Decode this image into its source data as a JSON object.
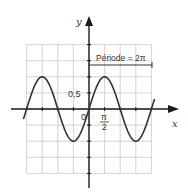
{
  "chart_data": {
    "type": "line",
    "title": "",
    "xlabel": "x",
    "ylabel": "y",
    "function": "y = sin(x)",
    "x_range": [
      -6.6,
      6.6
    ],
    "ylim": [
      -2,
      2
    ],
    "xlim": [
      -6.2832,
      6.2832
    ],
    "grid": true,
    "grid_step_x": "π/2",
    "grid_step_y": 0.5,
    "x_tick_labels": [
      {
        "value": 1.5708,
        "label": "π/2"
      }
    ],
    "y_tick_labels": [
      {
        "value": 0.5,
        "label": "0,5"
      }
    ],
    "origin_label": "0",
    "annotation": {
      "text": "Période = 2π",
      "from_x": 0,
      "to_x": 6.2832,
      "y": 1.5
    },
    "series": [
      {
        "name": "sin(x)",
        "x": [
          -6.2832,
          -4.7124,
          -3.1416,
          -1.5708,
          0,
          1.5708,
          3.1416,
          4.7124,
          6.2832
        ],
        "values": [
          0,
          1,
          0,
          -1,
          0,
          1,
          0,
          -1,
          0
        ]
      }
    ]
  },
  "labels": {
    "x_axis": "x",
    "y_axis": "y",
    "origin": "0",
    "y_tick": "0,5",
    "x_tick_num": "π",
    "x_tick_den": "2",
    "period": "Période = 2π"
  },
  "colors": {
    "grid": "#c8c8c8",
    "axis": "#1a1a1a",
    "curve": "#333333"
  }
}
